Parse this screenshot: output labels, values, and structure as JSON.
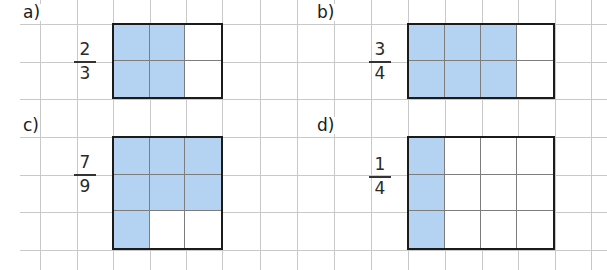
{
  "colors": {
    "fill": "#b4d2f2",
    "grid": "#c9c9c9",
    "box_border": "#1b1b1b",
    "inner_line": "#7d7d7d"
  },
  "grid": {
    "vertical_x": [
      40,
      77,
      113,
      150,
      186,
      222,
      260,
      297,
      334,
      371,
      408,
      445,
      482,
      518,
      555,
      591
    ],
    "horizontal_y": [
      24,
      62,
      99,
      137,
      175,
      212,
      250
    ]
  },
  "exercises": [
    {
      "id": "a",
      "label": "a)",
      "fraction": {
        "numerator": "2",
        "denominator": "3"
      },
      "box": {
        "x": 113,
        "y": 24,
        "cols": 3,
        "rows": 2,
        "cell_w": 36.7,
        "cell_h": 37.5
      },
      "filled_cells": [
        [
          0,
          0
        ],
        [
          0,
          1
        ],
        [
          1,
          0
        ],
        [
          1,
          1
        ]
      ]
    },
    {
      "id": "b",
      "label": "b)",
      "fraction": {
        "numerator": "3",
        "denominator": "4"
      },
      "box": {
        "x": 408,
        "y": 24,
        "cols": 4,
        "rows": 2,
        "cell_w": 36.8,
        "cell_h": 37.5
      },
      "filled_cells": [
        [
          0,
          0
        ],
        [
          0,
          1
        ],
        [
          0,
          2
        ],
        [
          1,
          0
        ],
        [
          1,
          1
        ],
        [
          1,
          2
        ]
      ]
    },
    {
      "id": "c",
      "label": "c)",
      "fraction": {
        "numerator": "7",
        "denominator": "9"
      },
      "box": {
        "x": 113,
        "y": 137,
        "cols": 3,
        "rows": 3,
        "cell_w": 36.7,
        "cell_h": 37.7
      },
      "filled_cells": [
        [
          0,
          0
        ],
        [
          0,
          1
        ],
        [
          0,
          2
        ],
        [
          1,
          0
        ],
        [
          1,
          1
        ],
        [
          1,
          2
        ],
        [
          2,
          0
        ]
      ]
    },
    {
      "id": "d",
      "label": "d)",
      "fraction": {
        "numerator": "1",
        "denominator": "4"
      },
      "box": {
        "x": 408,
        "y": 137,
        "cols": 4,
        "rows": 3,
        "cell_w": 36.8,
        "cell_h": 37.7
      },
      "filled_cells": [
        [
          0,
          0
        ],
        [
          1,
          0
        ],
        [
          2,
          0
        ]
      ]
    }
  ]
}
